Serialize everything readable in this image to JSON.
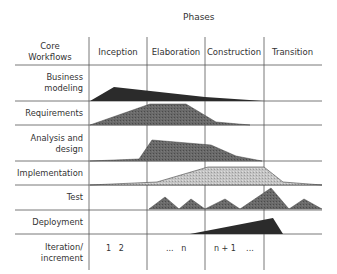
{
  "diagram": {
    "title": "Phases",
    "corner_label_line1": "Core",
    "corner_label_line2": "Workflows",
    "phases": [
      "Inception",
      "Elaboration",
      "Construction",
      "Transition"
    ],
    "workflows": [
      {
        "line1": "Business",
        "line2": "modeling"
      },
      {
        "line1": "Requirements",
        "line2": ""
      },
      {
        "line1": "Analysis and",
        "line2": "design"
      },
      {
        "line1": "Implementation",
        "line2": ""
      },
      {
        "line1": "Test",
        "line2": ""
      },
      {
        "line1": "Deployment",
        "line2": ""
      }
    ],
    "iteration_label_line1": "Iteration/",
    "iteration_label_line2": "increment",
    "iterations": {
      "inception": "1   2",
      "elaboration": "...   n",
      "construction": "n + 1    ..."
    },
    "colors": {
      "dark": "#2b2b2b",
      "medium": "#5c5c5c",
      "light": "#bdbdbd",
      "grid": "#555555"
    }
  }
}
